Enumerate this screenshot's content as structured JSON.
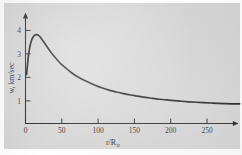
{
  "figure": {
    "panel_background": "#d4d4d4",
    "page_background": "#ffffff",
    "curve_color": "#101010",
    "axis_color": "#181818"
  },
  "chart_data": {
    "type": "line",
    "title": "",
    "subtitle": "",
    "xlabel": "r/R",
    "xlabel_sub": "⊙",
    "ylabel": "w, km/sec",
    "xlim": [
      0,
      297
    ],
    "ylim": [
      0,
      4.55
    ],
    "grid": false,
    "legend": null,
    "xticks": [
      0,
      50,
      100,
      150,
      200,
      250
    ],
    "xtick_labels": [
      "0",
      "50",
      "100",
      "150",
      "200",
      "250"
    ],
    "yticks": [
      1,
      2,
      3,
      4
    ],
    "ytick_labels": [
      "1",
      "2",
      "3",
      "4"
    ],
    "series": [
      {
        "name": "solar wind speed",
        "x": [
          1.5,
          2.5,
          3.5,
          4.5,
          6,
          7.5,
          9,
          10.5,
          12,
          13.5,
          15,
          16.5,
          18,
          20,
          22,
          25,
          28,
          32,
          36,
          40,
          45,
          50,
          56,
          62,
          70,
          78,
          86,
          95,
          105,
          115,
          125,
          135,
          145,
          155,
          165,
          175,
          185,
          195,
          205,
          215,
          225,
          235,
          245,
          255,
          265,
          275,
          285,
          295
        ],
        "y": [
          2.12,
          2.45,
          2.78,
          3.02,
          3.3,
          3.5,
          3.63,
          3.72,
          3.78,
          3.81,
          3.82,
          3.81,
          3.79,
          3.73,
          3.65,
          3.52,
          3.38,
          3.2,
          3.03,
          2.88,
          2.7,
          2.54,
          2.38,
          2.23,
          2.06,
          1.92,
          1.8,
          1.68,
          1.56,
          1.46,
          1.38,
          1.31,
          1.25,
          1.2,
          1.15,
          1.11,
          1.07,
          1.04,
          1.01,
          0.985,
          0.962,
          0.942,
          0.925,
          0.91,
          0.897,
          0.886,
          0.877,
          0.87
        ]
      }
    ],
    "annotations": {
      "peak_x": 15,
      "peak_y": 3.82,
      "start_y": 2.12,
      "tail_y": 0.87
    }
  }
}
